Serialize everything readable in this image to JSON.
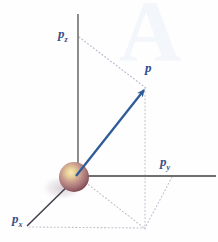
{
  "figure": {
    "background_color": "#fefeff",
    "watermark": {
      "text": "A",
      "color": "#eaf0f7"
    },
    "labels": {
      "pz_base": "p",
      "pz_sub": "z",
      "py_base": "p",
      "py_sub": "y",
      "px_base": "p",
      "px_sub": "x",
      "vector": "p"
    },
    "colors": {
      "axis": "#6b6b6b",
      "axis_x": "#3c3c48",
      "vector": "#2e5c97",
      "label": "#3a4f8a",
      "vector_label": "#2d4a92",
      "dotted": "#b9b9c4",
      "dotted_blue": "#a8b4cf",
      "sphere_light": "#f2e3a8",
      "sphere_mid": "#c59a8e",
      "sphere_dark": "#7d4a52",
      "shadow": "#c9c0c6"
    },
    "geometry": {
      "origin": [
        78,
        176
      ],
      "z_axis_top": [
        78,
        14
      ],
      "y_axis_end": [
        216,
        176
      ],
      "x_axis_end": [
        27,
        226
      ],
      "vector_tip": [
        146,
        87
      ],
      "z_projection": [
        79,
        37
      ],
      "xy_projection": [
        145,
        228
      ],
      "y_projection": [
        172,
        176
      ],
      "x_projection": [
        30,
        228
      ],
      "sphere_center": [
        74,
        177
      ],
      "sphere_radius": 15
    }
  }
}
